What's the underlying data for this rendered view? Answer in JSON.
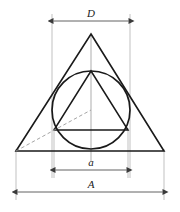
{
  "figure": {
    "background_color": "#ffffff",
    "stroke_color": "#1a1a1a",
    "thin_line_color": "#8c8c8c",
    "dashed_line_color": "#9a9a9a",
    "width": 180,
    "height": 212
  },
  "labels": {
    "diameter": "D",
    "inner_side": "a",
    "outer_base": "A"
  },
  "geometry": {
    "outer_triangle": {
      "apex": {
        "x": 91,
        "y": 34
      },
      "base_left": {
        "x": 16,
        "y": 151
      },
      "base_right": {
        "x": 164,
        "y": 151
      }
    },
    "circle": {
      "center": {
        "x": 91,
        "y": 110
      },
      "radius": 39,
      "left": 52,
      "right": 130,
      "top": 71,
      "bottom": 149
    },
    "inner_triangle": {
      "apex": {
        "x": 91,
        "y": 71
      },
      "base_left": {
        "x": 54,
        "y": 130
      },
      "base_right": {
        "x": 128,
        "y": 130
      }
    },
    "dashed_radius_line": {
      "from": {
        "x": 16,
        "y": 151
      },
      "to": {
        "x": 91,
        "y": 110
      }
    },
    "center_line": {
      "x": 91,
      "top": 34,
      "bottom": 160
    }
  },
  "dimensions": [
    {
      "name": "D",
      "label": "D",
      "y": 21,
      "x1": 52,
      "x2": 130,
      "measures": "circle diameter"
    },
    {
      "name": "a",
      "label": "a",
      "y": 170,
      "x1": 54,
      "x2": 128,
      "measures": "inner triangle side"
    },
    {
      "name": "A",
      "label": "A",
      "y": 192,
      "x1": 16,
      "x2": 164,
      "measures": "outer triangle base"
    }
  ],
  "extension_lines": [
    {
      "name": "ext-circle-left",
      "x": 52,
      "y1": 14,
      "y2": 178
    },
    {
      "name": "ext-circle-right",
      "x": 130,
      "y1": 14,
      "y2": 178
    },
    {
      "name": "ext-inner-left",
      "x": 54,
      "y1": 130,
      "y2": 178
    },
    {
      "name": "ext-inner-right",
      "x": 128,
      "y1": 130,
      "y2": 178
    },
    {
      "name": "ext-outer-left",
      "x": 16,
      "y1": 151,
      "y2": 200
    },
    {
      "name": "ext-outer-right",
      "x": 164,
      "y1": 151,
      "y2": 200
    }
  ]
}
